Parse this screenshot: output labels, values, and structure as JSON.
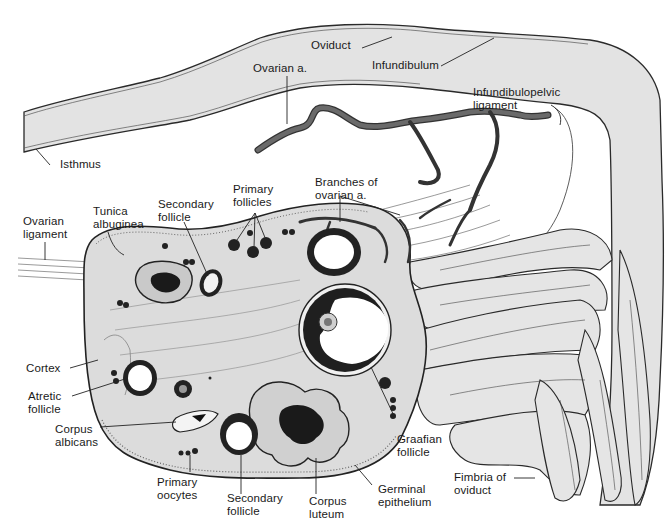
{
  "diagram": {
    "colors": {
      "tissue_fill": "#e2e2e2",
      "outline": "#2a2a2a",
      "artery": "#4a4a4a",
      "follicle_dark": "#1c1c1c",
      "background": "#ffffff"
    },
    "labels": {
      "oviduct": [
        "Oviduct"
      ],
      "ovarian_artery": [
        "Ovarian a."
      ],
      "infundibulum": [
        "Infundibulum"
      ],
      "infundibulopelvic_ligament": [
        "Infundibulopelvic",
        "ligament"
      ],
      "isthmus": [
        "Isthmus"
      ],
      "branches_ovarian_artery": [
        "Branches of",
        "ovarian a."
      ],
      "primary_follicles": [
        "Primary",
        "follicles"
      ],
      "secondary_follicle_top": [
        "Secondary",
        "follicle"
      ],
      "tunica_albuginea": [
        "Tunica",
        "albuginea"
      ],
      "ovarian_ligament": [
        "Ovarian",
        "ligament"
      ],
      "cortex": [
        "Cortex"
      ],
      "atretic_follicle": [
        "Atretic",
        "follicle"
      ],
      "corpus_albicans": [
        "Corpus",
        "albicans"
      ],
      "primary_oocytes": [
        "Primary",
        "oocytes"
      ],
      "secondary_follicle_bottom": [
        "Secondary",
        "follicle"
      ],
      "corpus_luteum": [
        "Corpus",
        "luteum"
      ],
      "germinal_epithelium": [
        "Germinal",
        "epithelium"
      ],
      "graafian_follicle": [
        "Graafian",
        "follicle"
      ],
      "fimbria_of_oviduct": [
        "Fimbria of",
        "oviduct"
      ]
    }
  }
}
